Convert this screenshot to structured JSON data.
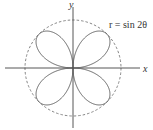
{
  "diagram": {
    "type": "polar-curve",
    "equation_label": "r = sin 2θ",
    "x_axis_label": "x",
    "y_axis_label": "y",
    "curve": {
      "name": "four-leaved rose",
      "formula": "sin 2θ",
      "petals": 4,
      "color": "#555555"
    },
    "bounding_circle": {
      "radius": 1,
      "style": "dashed",
      "color": "#777777"
    },
    "axis_color": "#444444"
  }
}
